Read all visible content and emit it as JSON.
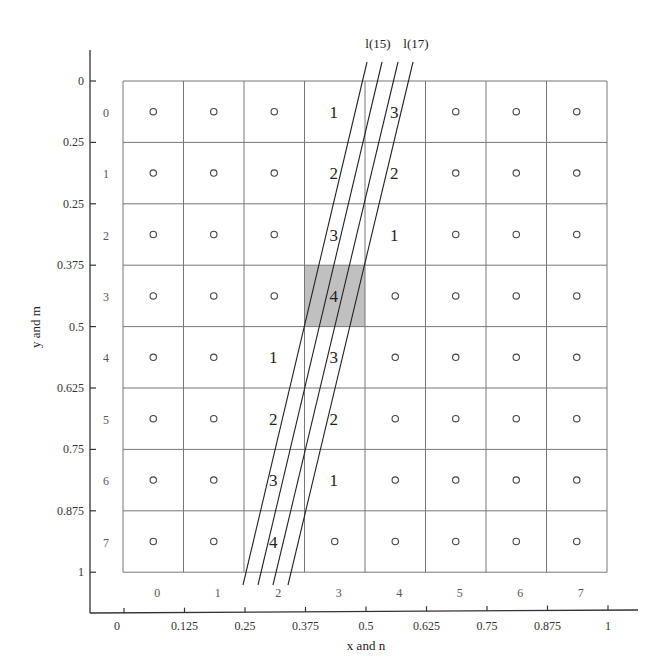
{
  "chart_data": {
    "type": "diagram",
    "xlabel": "x and n",
    "ylabel": "y and m",
    "x_ticks": [
      "0",
      "0.125",
      "0.25",
      "0.375",
      "0.5",
      "0.625",
      "0.75",
      "0.875",
      "1"
    ],
    "y_ticks": [
      "0",
      "0.25",
      "0.25",
      "0.375",
      "0.5",
      "0.625",
      "0.75",
      "0.875",
      "1"
    ],
    "column_indices": [
      "0",
      "1",
      "2",
      "3",
      "4",
      "5",
      "6",
      "7"
    ],
    "row_indices": [
      "0",
      "1",
      "2",
      "3",
      "4",
      "5",
      "6",
      "7"
    ],
    "line_labels": [
      "l(15)",
      "l(17)"
    ],
    "highlighted_cell": {
      "row": 3,
      "col": 3,
      "value": "4",
      "color": "#c0c0c0"
    },
    "grid": [
      [
        "o",
        "o",
        "o",
        "1",
        "3",
        "o",
        "o",
        "o"
      ],
      [
        "o",
        "o",
        "o",
        "2",
        "2",
        "o",
        "o",
        "o"
      ],
      [
        "o",
        "o",
        "o",
        "3",
        "1",
        "o",
        "o",
        "o"
      ],
      [
        "o",
        "o",
        "o",
        "4",
        "o",
        "o",
        "o",
        "o"
      ],
      [
        "o",
        "o",
        "1",
        "3",
        "o",
        "o",
        "o",
        "o"
      ],
      [
        "o",
        "o",
        "2",
        "2",
        "o",
        "o",
        "o",
        "o"
      ],
      [
        "o",
        "o",
        "3",
        "1",
        "o",
        "o",
        "o",
        "o"
      ],
      [
        "o",
        "o",
        "4",
        "o",
        "o",
        "o",
        "o",
        "o"
      ]
    ],
    "lines": [
      {
        "top": [
          367,
          62
        ],
        "bottom": [
          243,
          585
        ]
      },
      {
        "top": [
          382,
          62
        ],
        "bottom": [
          258,
          585
        ]
      },
      {
        "top": [
          398,
          62
        ],
        "bottom": [
          273,
          585
        ]
      },
      {
        "top": [
          413,
          62
        ],
        "bottom": [
          288,
          585
        ]
      }
    ]
  }
}
